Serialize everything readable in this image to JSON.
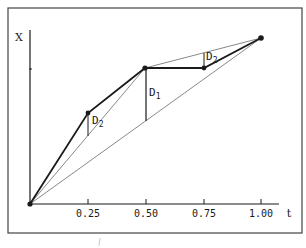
{
  "diagram": {
    "axes": {
      "y_label": "X",
      "x_label": "t",
      "x_ticks": [
        "0.25",
        "0.50",
        "0.75",
        "1.00"
      ]
    },
    "labels": {
      "d1_main": "D",
      "d1_sub": "1",
      "d2_left_main": "D",
      "d2_left_sub": "2",
      "d2_right_main": "D",
      "d2_right_sub": "2"
    },
    "colors": {
      "stroke": "#1a1a1a",
      "thin_stroke": "#555555",
      "frame": "#444444",
      "background": "#ffffff"
    },
    "points": [
      {
        "t": 0.0,
        "label": "origin"
      },
      {
        "t": 0.25,
        "label": "midpoint-level-2-left"
      },
      {
        "t": 0.5,
        "label": "midpoint-level-1"
      },
      {
        "t": 0.75,
        "label": "midpoint-level-2-right"
      },
      {
        "t": 1.0,
        "label": "end"
      }
    ]
  }
}
